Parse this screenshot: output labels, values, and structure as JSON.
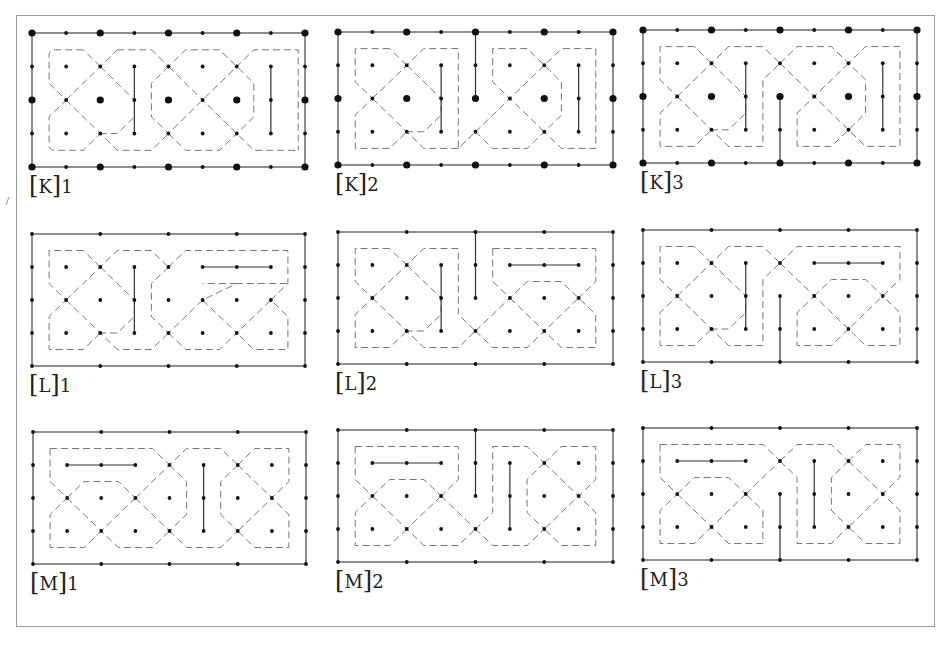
{
  "figure": {
    "frame_color": "#9a9a9a",
    "line_color": "#333333",
    "dash_color": "#777777",
    "grid": {
      "cols": 8,
      "rows": 4,
      "sx": 34.1,
      "sy": 33.3
    }
  },
  "panels": [
    {
      "id": "K1",
      "label_letter": "K",
      "label_num": "1",
      "x": 32,
      "y": 33,
      "border_dots": "all",
      "big_dots": true,
      "solid": [
        "M3,1 V3",
        "M7,1 V3"
      ],
      "dashed": [
        "M0.5,0.5 H1.5 L3.5,2.5 V3 L3,3.5 H2.5 L1.5,2.5 L0.5,3.5 V2.5 L0.75,2.25 L2.5,0.5",
        "M0.5,3.5 V1.5 L2.5,3.5 H1.5 L0.5,3.5",
        "M0.5,0.5 V1.5 L0.75,1.75",
        "M2.5,0.5 L3.5,1.5 V2.5",
        "M1,3.5 H2 L3,2.5",
        "M2.5,1.5 L3,0.5 H4.5 L5.5,1.5 L6.5,0.5 H7.5 L7.8,0.5 V3.5 H7 L6.5,3.5 L5.5,2.5 L4.5,3.5 H3.5 L2.5,2.5",
        "M4,0.5 L4.5,0.5 L3.5,1.5 V2.5 L5,3.5 H6 L6.5,3 V2 L5.5,1",
        "M3.5,3.5 L4.5,2.5 L6.5,0.5",
        "M4.5,0.5 L7.2,3.3"
      ],
      "paths_mode": "kolam-K"
    }
  ],
  "labels": [
    {
      "name": "label-K1",
      "letter": "K",
      "num": "1"
    },
    {
      "name": "label-K2",
      "letter": "K",
      "num": "2"
    },
    {
      "name": "label-K3",
      "letter": "K",
      "num": "3"
    },
    {
      "name": "label-L1",
      "letter": "L",
      "num": "1"
    },
    {
      "name": "label-L2",
      "letter": "L",
      "num": "2"
    },
    {
      "name": "label-L3",
      "letter": "L",
      "num": "3"
    },
    {
      "name": "label-M1",
      "letter": "M",
      "num": "1"
    },
    {
      "name": "label-M2",
      "letter": "M",
      "num": "2"
    },
    {
      "name": "label-M3",
      "letter": "M",
      "num": "3"
    }
  ],
  "layout": [
    {
      "id": "K1",
      "x": 32,
      "y": 33,
      "w": 273,
      "h": 134
    },
    {
      "id": "K2",
      "x": 338,
      "y": 32,
      "w": 275,
      "h": 133
    },
    {
      "id": "K3",
      "x": 643,
      "y": 30,
      "w": 274,
      "h": 133
    },
    {
      "id": "L1",
      "x": 32,
      "y": 234,
      "w": 273,
      "h": 132
    },
    {
      "id": "L2",
      "x": 338,
      "y": 232,
      "w": 275,
      "h": 132
    },
    {
      "id": "L3",
      "x": 643,
      "y": 230,
      "w": 274,
      "h": 132
    },
    {
      "id": "M1",
      "x": 33,
      "y": 432,
      "w": 273,
      "h": 132
    },
    {
      "id": "M2",
      "x": 338,
      "y": 430,
      "w": 275,
      "h": 132
    },
    {
      "id": "M3",
      "x": 643,
      "y": 428,
      "w": 274,
      "h": 132
    }
  ],
  "designs": {
    "K1": {
      "family": "K",
      "big_dots": true,
      "solid": [
        [
          [
            3,
            1
          ],
          [
            3,
            3
          ]
        ],
        [
          [
            7,
            1
          ],
          [
            7,
            3
          ]
        ]
      ],
      "dashed": [
        [
          [
            1.5,
            0.5
          ],
          [
            0.5,
            0.5
          ],
          [
            0.5,
            1.5
          ],
          [
            1,
            2
          ],
          [
            0.5,
            2.5
          ],
          [
            0.5,
            3.5
          ],
          [
            1.5,
            3.5
          ],
          [
            3.5,
            1.5
          ],
          [
            3.5,
            0.5
          ]
        ],
        [
          [
            1.5,
            0.5
          ],
          [
            3.5,
            2.5
          ],
          [
            3.5,
            3.5
          ],
          [
            4.5,
            3.5
          ],
          [
            6.5,
            1.5
          ],
          [
            6.5,
            0.5
          ],
          [
            7.5,
            0.5
          ],
          [
            7.5,
            3.5
          ],
          [
            6.5,
            3.5
          ],
          [
            4.5,
            1.5
          ],
          [
            4.5,
            0.5
          ],
          [
            3.5,
            0.5
          ]
        ],
        [
          [
            1.5,
            3.5
          ],
          [
            2,
            3.5
          ],
          [
            3,
            2.5
          ]
        ],
        [
          [
            4.5,
            0.5
          ],
          [
            5.5,
            0.5
          ],
          [
            7,
            2
          ],
          [
            5.5,
            3.5
          ],
          [
            4.5,
            3.5
          ]
        ]
      ]
    },
    "K2": {
      "family": "K",
      "big_dots": true,
      "solid": [
        [
          [
            3,
            1
          ],
          [
            3,
            3
          ]
        ],
        [
          [
            7,
            1
          ],
          [
            7,
            3
          ]
        ],
        [
          [
            4,
            0
          ],
          [
            4,
            2
          ]
        ]
      ],
      "dashed": []
    },
    "K3": {
      "family": "K",
      "big_dots": true,
      "solid": [
        [
          [
            3,
            1
          ],
          [
            3,
            3
          ]
        ],
        [
          [
            7,
            1
          ],
          [
            7,
            3
          ]
        ],
        [
          [
            4,
            2
          ],
          [
            4,
            4
          ]
        ]
      ],
      "dashed": []
    },
    "L1": {
      "family": "L",
      "big_dots": false,
      "solid": [
        [
          [
            3,
            1
          ],
          [
            3,
            3
          ]
        ],
        [
          [
            5,
            1
          ],
          [
            7,
            1
          ]
        ]
      ],
      "dashed": []
    },
    "L2": {
      "family": "L",
      "big_dots": false,
      "solid": [
        [
          [
            3,
            1
          ],
          [
            3,
            3
          ]
        ],
        [
          [
            5,
            1
          ],
          [
            7,
            1
          ]
        ],
        [
          [
            4,
            0
          ],
          [
            4,
            2
          ]
        ]
      ],
      "dashed": []
    },
    "L3": {
      "family": "L",
      "big_dots": false,
      "solid": [
        [
          [
            3,
            1
          ],
          [
            3,
            3
          ]
        ],
        [
          [
            5,
            1
          ],
          [
            7,
            1
          ]
        ],
        [
          [
            4,
            2
          ],
          [
            4,
            4
          ]
        ]
      ],
      "dashed": []
    },
    "M1": {
      "family": "M",
      "big_dots": false,
      "solid": [
        [
          [
            1,
            1
          ],
          [
            3,
            1
          ]
        ],
        [
          [
            5,
            1
          ],
          [
            5,
            3
          ]
        ]
      ],
      "dashed": []
    },
    "M2": {
      "family": "M",
      "big_dots": false,
      "solid": [
        [
          [
            1,
            1
          ],
          [
            3,
            1
          ]
        ],
        [
          [
            5,
            1
          ],
          [
            5,
            3
          ]
        ],
        [
          [
            4,
            0
          ],
          [
            4,
            2
          ]
        ]
      ],
      "dashed": []
    },
    "M3": {
      "family": "M",
      "big_dots": false,
      "solid": [
        [
          [
            1,
            1
          ],
          [
            3,
            1
          ]
        ],
        [
          [
            5,
            1
          ],
          [
            5,
            3
          ]
        ],
        [
          [
            4,
            2
          ],
          [
            4,
            4
          ]
        ]
      ],
      "dashed": []
    }
  }
}
